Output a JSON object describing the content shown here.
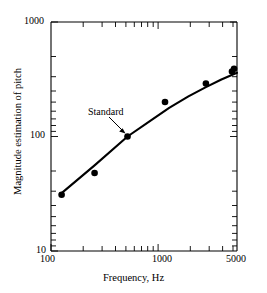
{
  "chart_data": {
    "type": "scatter",
    "title": "",
    "xlabel": "Frequency, Hz",
    "ylabel": "Magnitude estimation of pitch",
    "xscale": "log",
    "yscale": "log",
    "xlim": [
      100,
      5000
    ],
    "ylim": [
      10,
      1000
    ],
    "grid": false,
    "legend": null,
    "x_tick_labels": [
      "100",
      "1000",
      "5000"
    ],
    "x_tick_values": [
      100,
      1000,
      5000
    ],
    "y_tick_labels": [
      "10",
      "100",
      "1000"
    ],
    "y_tick_values": [
      10,
      100,
      1000
    ],
    "x": [
      125,
      250,
      500,
      1100,
      2600,
      4500,
      4700
    ],
    "values": [
      31,
      48,
      100,
      200,
      290,
      370,
      390
    ],
    "series": [
      {
        "name": "Magnitude estimation of pitch",
        "marker": "filled-circle",
        "color": "#000000",
        "points": [
          {
            "x": 125,
            "y": 31
          },
          {
            "x": 250,
            "y": 48
          },
          {
            "x": 500,
            "y": 100
          },
          {
            "x": 1100,
            "y": 200
          },
          {
            "x": 2600,
            "y": 290
          },
          {
            "x": 4500,
            "y": 370
          },
          {
            "x": 4700,
            "y": 390
          }
        ]
      }
    ],
    "fit_curve": {
      "name": "fitted curve",
      "color": "#000000",
      "points": [
        {
          "x": 125,
          "y": 32
        },
        {
          "x": 250,
          "y": 56
        },
        {
          "x": 500,
          "y": 100
        },
        {
          "x": 800,
          "y": 136
        },
        {
          "x": 1200,
          "y": 178
        },
        {
          "x": 1800,
          "y": 224
        },
        {
          "x": 2600,
          "y": 270
        },
        {
          "x": 3600,
          "y": 315
        },
        {
          "x": 5000,
          "y": 360
        }
      ]
    },
    "annotations": [
      {
        "text": "Standard",
        "points_to_x": 500,
        "points_to_y": 100
      }
    ]
  },
  "axes": {
    "x_title": "Frequency, Hz",
    "y_title": "Magnitude estimation of pitch",
    "x_ticks": [
      {
        "label": "100",
        "value": 100
      },
      {
        "label": "1000",
        "value": 1000
      },
      {
        "label": "5000",
        "value": 5000
      }
    ],
    "y_ticks": [
      {
        "label": "1000",
        "value": 1000
      },
      {
        "label": "100",
        "value": 100
      },
      {
        "label": "10",
        "value": 10
      }
    ]
  },
  "annotation": {
    "standard_label": "Standard"
  },
  "style": {
    "axis_color": "#000000",
    "marker_color": "#000000",
    "curve_color": "#000000",
    "background": "#ffffff"
  }
}
